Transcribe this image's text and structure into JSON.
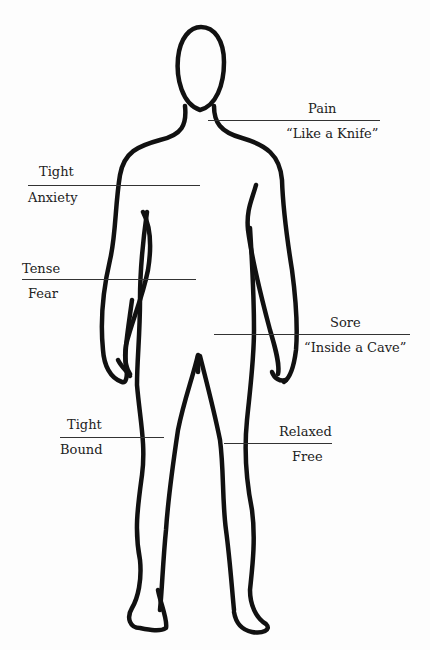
{
  "diagram": {
    "annotations": [
      {
        "id": "chest",
        "top_label": "Pain",
        "bottom_label": "“Like a Knife”",
        "side": "right"
      },
      {
        "id": "upper-torso",
        "top_label": "Tight",
        "bottom_label": "Anxiety",
        "side": "left"
      },
      {
        "id": "abdomen",
        "top_label": "Tense",
        "bottom_label": "Fear",
        "side": "left"
      },
      {
        "id": "pelvis",
        "top_label": "Sore",
        "bottom_label": "“Inside a Cave”",
        "side": "right"
      },
      {
        "id": "right-leg",
        "top_label": "Tight",
        "bottom_label": "Bound",
        "side": "left"
      },
      {
        "id": "left-leg",
        "top_label": "Relaxed",
        "bottom_label": "Free",
        "side": "right"
      }
    ],
    "colors": {
      "outline": "#111111",
      "rule": "#333333",
      "text": "#222222",
      "background": "#fdfdfd"
    }
  }
}
